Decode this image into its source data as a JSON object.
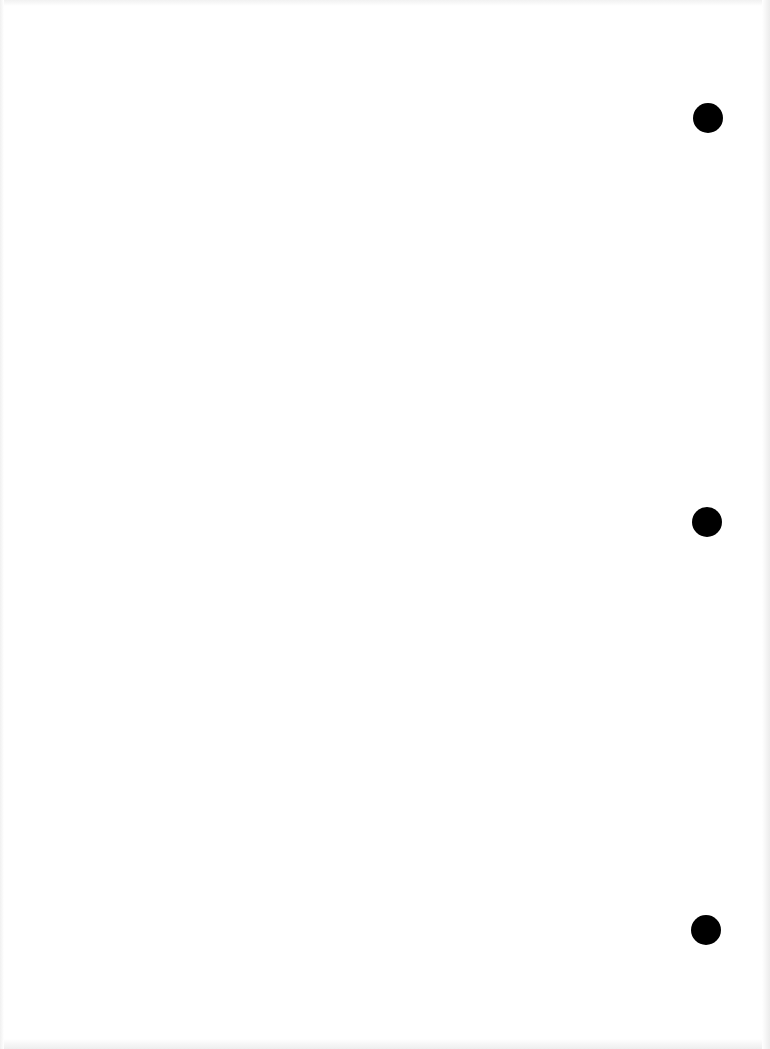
{
  "document": {
    "type": "blank-page",
    "background_color": "#ffffff",
    "punch_holes": [
      {
        "cx": 708,
        "cy": 118,
        "r": 15,
        "color": "#000000"
      },
      {
        "cx": 707,
        "cy": 522,
        "r": 15,
        "color": "#000000"
      },
      {
        "cx": 706,
        "cy": 930,
        "r": 15,
        "color": "#000000"
      }
    ]
  }
}
